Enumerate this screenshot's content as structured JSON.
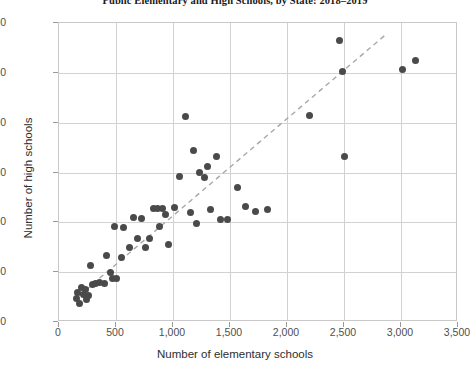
{
  "chart_data": {
    "type": "scatter",
    "title": "Public Elementary and High Schools, by State: 2018–2019",
    "xlabel": "Number of elementary schools",
    "ylabel": "Number of high schools",
    "xlim": [
      0,
      3500
    ],
    "ylim": [
      0,
      1200
    ],
    "xticks": [
      0,
      500,
      1000,
      1500,
      2000,
      2500,
      3000,
      3500
    ],
    "xtick_labels": [
      "0",
      "500",
      "1,000",
      "1,500",
      "2,000",
      "2,500",
      "3,000",
      "3,500"
    ],
    "yticks": [
      0,
      200,
      400,
      600,
      800,
      1000,
      1200
    ],
    "ytick_labels": [
      "0",
      "200",
      "400",
      "600",
      "800",
      "1000",
      "1200"
    ],
    "grid": true,
    "legend": "none",
    "marker_color": "#4a4a4a",
    "marker_size": 7,
    "trendline": {
      "style": "dashed",
      "color": "#a8a8a8",
      "x_start": 175,
      "y_start": 105,
      "x_end": 2870,
      "y_end": 1155
    },
    "points": [
      {
        "x": 150,
        "y": 95
      },
      {
        "x": 165,
        "y": 120
      },
      {
        "x": 180,
        "y": 75
      },
      {
        "x": 195,
        "y": 140
      },
      {
        "x": 215,
        "y": 110
      },
      {
        "x": 230,
        "y": 130
      },
      {
        "x": 245,
        "y": 90
      },
      {
        "x": 255,
        "y": 105
      },
      {
        "x": 275,
        "y": 225
      },
      {
        "x": 290,
        "y": 150
      },
      {
        "x": 320,
        "y": 155
      },
      {
        "x": 355,
        "y": 160
      },
      {
        "x": 395,
        "y": 155
      },
      {
        "x": 420,
        "y": 265
      },
      {
        "x": 455,
        "y": 200
      },
      {
        "x": 470,
        "y": 175
      },
      {
        "x": 490,
        "y": 385
      },
      {
        "x": 500,
        "y": 175
      },
      {
        "x": 545,
        "y": 260
      },
      {
        "x": 565,
        "y": 380
      },
      {
        "x": 620,
        "y": 300
      },
      {
        "x": 650,
        "y": 420
      },
      {
        "x": 690,
        "y": 335
      },
      {
        "x": 720,
        "y": 415
      },
      {
        "x": 760,
        "y": 300
      },
      {
        "x": 790,
        "y": 335
      },
      {
        "x": 830,
        "y": 455
      },
      {
        "x": 860,
        "y": 455
      },
      {
        "x": 880,
        "y": 385
      },
      {
        "x": 905,
        "y": 455
      },
      {
        "x": 930,
        "y": 430
      },
      {
        "x": 960,
        "y": 310
      },
      {
        "x": 1010,
        "y": 460
      },
      {
        "x": 1060,
        "y": 585
      },
      {
        "x": 1110,
        "y": 825
      },
      {
        "x": 1150,
        "y": 440
      },
      {
        "x": 1180,
        "y": 690
      },
      {
        "x": 1210,
        "y": 395
      },
      {
        "x": 1235,
        "y": 600
      },
      {
        "x": 1275,
        "y": 580
      },
      {
        "x": 1300,
        "y": 625
      },
      {
        "x": 1330,
        "y": 450
      },
      {
        "x": 1380,
        "y": 665
      },
      {
        "x": 1420,
        "y": 410
      },
      {
        "x": 1475,
        "y": 410
      },
      {
        "x": 1570,
        "y": 540
      },
      {
        "x": 1640,
        "y": 465
      },
      {
        "x": 1720,
        "y": 445
      },
      {
        "x": 1830,
        "y": 450
      },
      {
        "x": 2200,
        "y": 830
      },
      {
        "x": 2460,
        "y": 1130
      },
      {
        "x": 2490,
        "y": 1005
      },
      {
        "x": 2500,
        "y": 665
      },
      {
        "x": 3010,
        "y": 1015
      },
      {
        "x": 3130,
        "y": 1050
      }
    ]
  }
}
